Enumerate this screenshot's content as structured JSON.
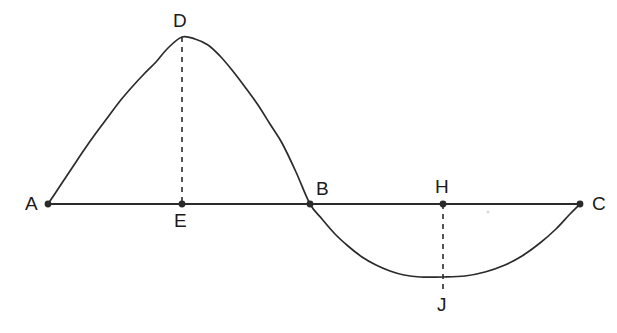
{
  "figure": {
    "background_color": "#ffffff",
    "stroke_color": "#2b2b2b",
    "text_color": "#1a1a1a",
    "width": 617,
    "height": 333,
    "baseline_y": 204,
    "axis_start_x": 48,
    "axis_end_x": 580
  },
  "points": [
    {
      "label": "A",
      "x": 48,
      "y": 204,
      "dot": true,
      "label_x": 25,
      "label_y": 196
    },
    {
      "label": "D",
      "x": 182,
      "y": 37,
      "dot": false,
      "label_x": 173,
      "label_y": 12
    },
    {
      "label": "E",
      "x": 182,
      "y": 204,
      "dot": true,
      "label_x": 173,
      "label_y": 212
    },
    {
      "label": "B",
      "x": 310,
      "y": 204,
      "dot": true,
      "label_x": 316,
      "label_y": 180
    },
    {
      "label": "H",
      "x": 443,
      "y": 204,
      "dot": true,
      "label_x": 435,
      "label_y": 178
    },
    {
      "label": "J",
      "x": 443,
      "y": 277,
      "dot": false,
      "label_x": 436,
      "label_y": 296
    },
    {
      "label": "C",
      "x": 580,
      "y": 204,
      "dot": true,
      "label_x": 592,
      "label_y": 196
    }
  ],
  "dashed_segments": [
    {
      "name": "crest-to-baseline",
      "x": 182,
      "y1": 37,
      "y2": 204
    },
    {
      "name": "baseline-to-trough",
      "x": 443,
      "y1": 204,
      "y2": 290
    }
  ],
  "chart_data": {
    "type": "line",
    "xlabel": "",
    "ylabel": "",
    "grid": false,
    "legend": "none",
    "xlim": [
      48,
      580
    ],
    "ylim": [
      37,
      277
    ],
    "annotations": [
      {
        "label": "A",
        "role": "left-endpoint-on-axis"
      },
      {
        "label": "D",
        "role": "crest-of-first-hump"
      },
      {
        "label": "E",
        "role": "foot-of-crest-on-axis"
      },
      {
        "label": "B",
        "role": "midpoint-zero-crossing"
      },
      {
        "label": "H",
        "role": "foot-of-trough-on-axis"
      },
      {
        "label": "J",
        "role": "trough-of-second-hump"
      },
      {
        "label": "C",
        "role": "right-endpoint-on-axis"
      }
    ],
    "series": [
      {
        "name": "sine-curve",
        "x": [
          48,
          60,
          72,
          84,
          96,
          108,
          120,
          132,
          144,
          156,
          168,
          182,
          195,
          208,
          220,
          232,
          245,
          258,
          270,
          282,
          296,
          310,
          322,
          335,
          348,
          362,
          376,
          390,
          404,
          420,
          443,
          465,
          485,
          505,
          522,
          540,
          556,
          570,
          580
        ],
        "y": [
          204,
          186,
          168,
          150,
          133,
          117,
          101,
          87,
          74,
          62,
          48,
          37,
          39,
          45,
          56,
          70,
          87,
          105,
          124,
          143,
          172,
          204,
          219,
          234,
          246,
          257,
          265,
          271,
          275,
          277,
          277,
          276,
          272,
          265,
          256,
          243,
          229,
          214,
          204
        ]
      },
      {
        "name": "baseline-axis",
        "x": [
          48,
          580
        ],
        "y": [
          204,
          204
        ]
      }
    ]
  }
}
